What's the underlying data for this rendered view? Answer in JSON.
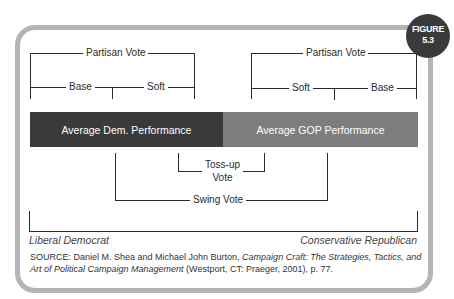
{
  "figure": {
    "badge_line1": "FIGURE",
    "badge_line2": "5.3"
  },
  "left_group": {
    "partisan": "Partisan Vote",
    "base": "Base",
    "soft": "Soft"
  },
  "right_group": {
    "partisan": "Partisan Vote",
    "soft": "Soft",
    "base": "Base"
  },
  "bars": {
    "dem": {
      "label": "Average Dem. Performance",
      "color": "#3a3a3a"
    },
    "gop": {
      "label": "Average GOP Performance",
      "color": "#7d7d7d"
    }
  },
  "tossup": {
    "line1": "Toss-up",
    "line2": "Vote"
  },
  "swing": "Swing Vote",
  "spectrum": {
    "left": "Liberal Democrat",
    "right": "Conservative Republican"
  },
  "source": {
    "prefix": "SOURCE: Daniel M. Shea and Michael John Burton, ",
    "title": "Campaign Craft: The Strategies, Tactics, and Art of Political Campaign Management",
    "suffix": " (Westport, CT: Praeger, 2001), p. 77."
  }
}
